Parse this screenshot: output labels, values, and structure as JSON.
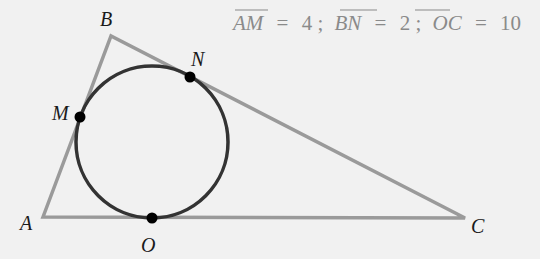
{
  "diagram": {
    "colors": {
      "background": "#f1f1f1",
      "triangle": "#9a9a9a",
      "circle": "#333333",
      "points": "#000000",
      "given_text": "#8a8a8a"
    },
    "vertices": {
      "A": {
        "label": "A",
        "x": 43,
        "y": 217
      },
      "B": {
        "label": "B",
        "x": 111,
        "y": 36
      },
      "C": {
        "label": "C",
        "x": 465,
        "y": 218
      }
    },
    "tangent_points": {
      "M": {
        "label": "M",
        "x": 80,
        "y": 117
      },
      "N": {
        "label": "N",
        "x": 190,
        "y": 77
      },
      "O": {
        "label": "O",
        "x": 152,
        "y": 218
      }
    },
    "incircle": {
      "cx": 152,
      "cy": 142,
      "r": 76
    },
    "given": {
      "segments": [
        {
          "name": "AM",
          "value": "4"
        },
        {
          "name": "BN",
          "value": "2"
        },
        {
          "name": "OC",
          "value": "10"
        }
      ],
      "equals": "=",
      "separator": ";"
    }
  }
}
